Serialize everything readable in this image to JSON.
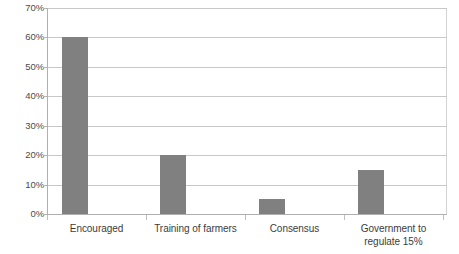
{
  "chart_data": {
    "type": "bar",
    "title": "",
    "subtitle": "",
    "xlabel": "",
    "ylabel": "",
    "categories": [
      "Encouraged",
      "Training of farmers",
      "Consensus",
      "Government to regulate 15%"
    ],
    "values": [
      60,
      20,
      5,
      15
    ],
    "value_labels": [
      "60%",
      "20%",
      "5%",
      "15%"
    ],
    "ylim": [
      0,
      70
    ],
    "ytick_labels": [
      "0%",
      "10%",
      "20%",
      "30%",
      "40%",
      "50%",
      "60%",
      "70%"
    ],
    "ytick_values": [
      0,
      10,
      20,
      30,
      40,
      50,
      60,
      70
    ],
    "grid": true,
    "legend": false,
    "legend_position": "none",
    "series": [
      {
        "name": "Series 1",
        "values": [
          60,
          20,
          5,
          15
        ],
        "color": "#808080"
      }
    ],
    "colors": {
      "bar": "#808080",
      "gridline": "#c8c8c8",
      "axis": "#b0b0b0",
      "text": "#3c3c3c",
      "plot_background": "#ffffff",
      "frame_border": "#d4d4d4"
    }
  },
  "axis": {
    "y_ticks": [
      {
        "label": "70%",
        "value": 70
      },
      {
        "label": "60%",
        "value": 60
      },
      {
        "label": "50%",
        "value": 50
      },
      {
        "label": "40%",
        "value": 40
      },
      {
        "label": "30%",
        "value": 30
      },
      {
        "label": "20%",
        "value": 20
      },
      {
        "label": "10%",
        "value": 10
      },
      {
        "label": "0%",
        "value": 0
      }
    ],
    "x_categories": [
      {
        "line1": "Encouraged",
        "line2": ""
      },
      {
        "line1": "Training of farmers",
        "line2": ""
      },
      {
        "line1": "Consensus",
        "line2": ""
      },
      {
        "line1": "Government to",
        "line2": "regulate 15%"
      }
    ]
  }
}
